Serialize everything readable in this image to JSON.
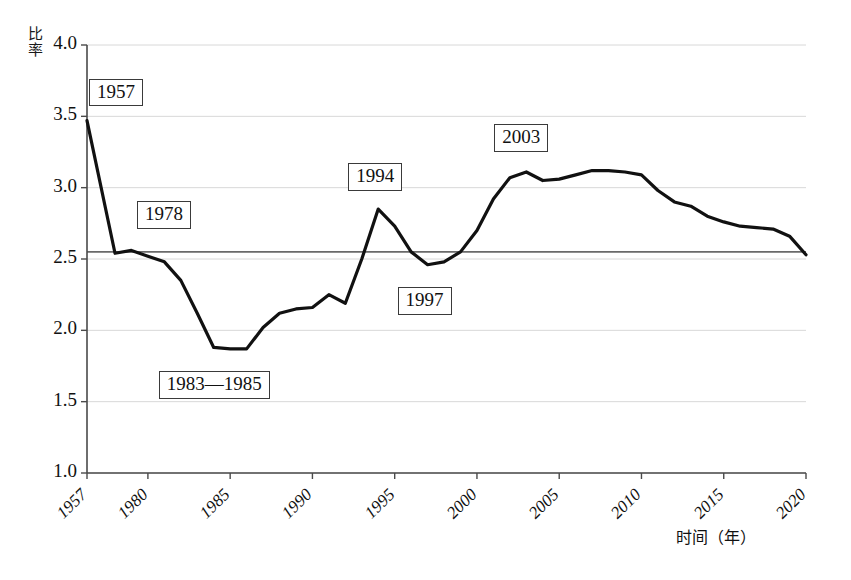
{
  "chart_data": {
    "type": "line",
    "title": "",
    "xlabel": "时间（年）",
    "ylabel": "比率",
    "ylim": [
      1.0,
      4.0
    ],
    "grid": true,
    "legend": "none",
    "y_ticks": [
      "1.0",
      "1.5",
      "2.0",
      "2.5",
      "3.0",
      "3.5",
      "4.0"
    ],
    "y_tick_values": [
      1.0,
      1.5,
      2.0,
      2.5,
      3.0,
      3.5,
      4.0
    ],
    "x_ticks": [
      "1957",
      "1980",
      "1985",
      "1990",
      "1995",
      "2000",
      "2005",
      "2010",
      "2015",
      "2020"
    ],
    "x_tick_values": [
      1957,
      1980,
      1985,
      1990,
      1995,
      2000,
      2005,
      2010,
      2015,
      2020
    ],
    "reference_line": {
      "label": "",
      "value": 2.55
    },
    "series": [
      {
        "name": "比率",
        "color": "#111111",
        "x": [
          1957,
          1978,
          1979,
          1980,
          1981,
          1982,
          1983,
          1984,
          1985,
          1986,
          1987,
          1988,
          1989,
          1990,
          1991,
          1992,
          1993,
          1994,
          1995,
          1996,
          1997,
          1998,
          1999,
          2000,
          2001,
          2002,
          2003,
          2004,
          2005,
          2006,
          2007,
          2008,
          2009,
          2010,
          2011,
          2012,
          2013,
          2014,
          2015,
          2016,
          2017,
          2018,
          2019,
          2020
        ],
        "values": [
          3.47,
          2.54,
          2.56,
          2.52,
          2.48,
          2.35,
          2.12,
          1.88,
          1.87,
          1.87,
          2.02,
          2.12,
          2.15,
          2.16,
          2.25,
          2.19,
          2.5,
          2.85,
          2.73,
          2.55,
          2.46,
          2.48,
          2.55,
          2.7,
          2.92,
          3.07,
          3.11,
          3.05,
          3.06,
          3.09,
          3.12,
          3.12,
          3.11,
          3.09,
          2.98,
          2.9,
          2.87,
          2.8,
          2.76,
          2.73,
          2.72,
          2.71,
          2.66,
          2.53
        ]
      }
    ],
    "annotations": [
      {
        "text": "1957",
        "x": 1957,
        "value": 3.47
      },
      {
        "text": "1978",
        "x": 1978,
        "value": 2.54
      },
      {
        "text": "1983—1985",
        "x": 1984,
        "value": 1.87
      },
      {
        "text": "1994",
        "x": 1994,
        "value": 2.85
      },
      {
        "text": "1997",
        "x": 1997,
        "value": 2.46
      },
      {
        "text": "2003",
        "x": 2003,
        "value": 3.11
      }
    ]
  },
  "axes": {
    "y_label": "比率",
    "x_label": "时间（年）",
    "y_tick_labels": [
      "4.0",
      "3.5",
      "3.0",
      "2.5",
      "2.0",
      "1.5",
      "1.0"
    ],
    "x_tick_labels": [
      "1957",
      "1980",
      "1985",
      "1990",
      "1995",
      "2000",
      "2005",
      "2010",
      "2015",
      "2020"
    ]
  },
  "annotation_labels": [
    "1957",
    "1978",
    "1983—1985",
    "1994",
    "1997",
    "2003"
  ],
  "colors": {
    "line": "#111111",
    "grid": "#d8d8d8",
    "axis": "#4a4a4a",
    "reference_line": "#6a6a6a",
    "annotation_border": "#3a3a3a",
    "background": "#ffffff"
  }
}
